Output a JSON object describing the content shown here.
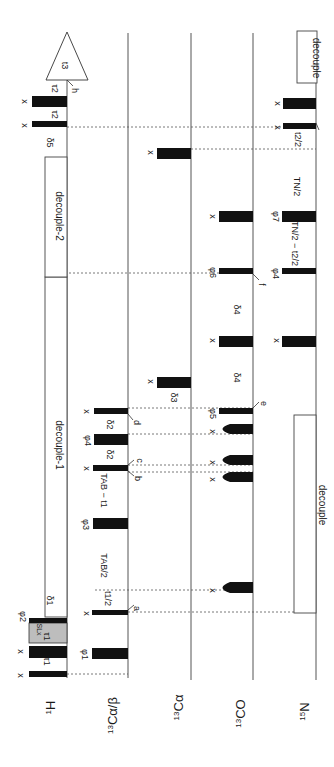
{
  "orientation": "rotated-90deg; time runs bottom-to-top, channels left-to-right",
  "channels": [
    {
      "id": "1H",
      "mass": "1",
      "label": "H",
      "x": 67
    },
    {
      "id": "13Ca/b",
      "mass": "13",
      "label": "Cα/β",
      "x": 128
    },
    {
      "id": "13Ca",
      "mass": "13",
      "label": "Cα",
      "x": 191
    },
    {
      "id": "13CO",
      "mass": "13",
      "label": "CO",
      "x": 253
    },
    {
      "id": "15N",
      "mass": "15",
      "label": "N",
      "x": 316
    }
  ],
  "boxes": {
    "decouple_1": "decouple-1",
    "decouple_2": "decouple-2",
    "decouple_15N": "decouple",
    "decouple_15N_acq": "decouple",
    "acquisition": "t3",
    "spinlock": "SLx"
  },
  "phases": {
    "x": "x",
    "phi1": "φ1",
    "phi2": "φ2",
    "phi3": "φ3",
    "phi4": "φ4",
    "phi5": "φ5",
    "phi6": "φ6",
    "phi7": "φ7"
  },
  "delays": {
    "tau1": "τ1",
    "tau2": "τ2",
    "delta1": "δ1",
    "delta2": "δ2",
    "delta3": "δ3",
    "delta4": "δ4",
    "delta5": "δ5",
    "t1_half_num": "t1",
    "t1_half_den": "2",
    "TAB_half_num": "TAB",
    "TAB_half_den": "2",
    "TAB_minus_t1_half": "TAB − t1",
    "TN_half_num": "TN",
    "TN_half_den": "2",
    "t2_half_num": "t2",
    "t2_half_den": "2",
    "TN_minus_t2": "TN/2 − t2/2"
  },
  "markers": [
    "a",
    "b",
    "c",
    "d",
    "e",
    "f",
    "h"
  ]
}
